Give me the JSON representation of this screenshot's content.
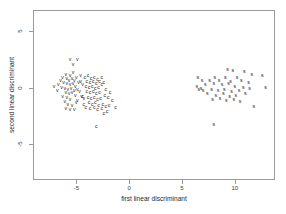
{
  "chart_data": {
    "type": "scatter",
    "title": "",
    "xlabel": "first linear discriminant",
    "ylabel": "second linear discriminant",
    "xlim": [
      -9.1,
      13.8
    ],
    "ylim": [
      -8.2,
      6.9
    ],
    "xticks": [
      -5,
      0,
      5,
      10
    ],
    "xticklabels": [
      "-5",
      "0",
      "5",
      "10"
    ],
    "yticks": [
      5,
      0,
      -5
    ],
    "yticklabels": [
      "5",
      "0",
      "-5"
    ],
    "grid": false,
    "legend": "none",
    "marker_style": "text-glyph",
    "series": [
      {
        "name": "v",
        "label": "v",
        "color": "#1a1a1a",
        "points": [
          [
            -5.6,
            2.5
          ],
          [
            -4.9,
            2.5
          ],
          [
            -5.3,
            2.0
          ],
          [
            -7.1,
            0.1
          ],
          [
            -6.3,
            0.9
          ],
          [
            -6.0,
            1.1
          ],
          [
            -5.6,
            1.0
          ],
          [
            -5.9,
            0.8
          ],
          [
            -5.7,
            0.6
          ],
          [
            -5.4,
            0.8
          ],
          [
            -5.2,
            0.6
          ],
          [
            -5.0,
            0.9
          ],
          [
            -6.2,
            0.4
          ],
          [
            -5.9,
            0.3
          ],
          [
            -5.6,
            0.2
          ],
          [
            -5.3,
            0.3
          ],
          [
            -5.1,
            0.1
          ],
          [
            -4.8,
            0.4
          ],
          [
            -6.4,
            0.0
          ],
          [
            -6.1,
            -0.1
          ],
          [
            -5.8,
            -0.2
          ],
          [
            -5.5,
            -0.1
          ],
          [
            -5.2,
            -0.3
          ],
          [
            -4.9,
            -0.2
          ],
          [
            -6.0,
            -0.5
          ],
          [
            -5.7,
            -0.6
          ],
          [
            -5.4,
            -0.5
          ],
          [
            -5.1,
            -0.7
          ],
          [
            -6.3,
            -0.8
          ],
          [
            -5.9,
            -0.9
          ],
          [
            -5.6,
            -1.1
          ],
          [
            -6.1,
            -1.3
          ],
          [
            -5.8,
            -1.5
          ],
          [
            -5.4,
            -1.6
          ],
          [
            -6.0,
            -1.9
          ],
          [
            -5.6,
            -2.0
          ],
          [
            -5.2,
            -2.0
          ],
          [
            -4.6,
            0.5
          ],
          [
            -4.4,
            0.2
          ],
          [
            -4.7,
            -0.4
          ],
          [
            -4.5,
            -0.8
          ],
          [
            -4.3,
            -1.0
          ],
          [
            -4.9,
            -1.2
          ],
          [
            -6.5,
            0.6
          ],
          [
            -6.7,
            0.2
          ],
          [
            -5.0,
            -1.4
          ],
          [
            -4.6,
            1.0
          ],
          [
            -6.8,
            -0.3
          ],
          [
            -5.3,
            1.3
          ]
        ]
      },
      {
        "name": "c",
        "label": "c",
        "color": "#1a1a1a",
        "points": [
          [
            -4.2,
            0.9
          ],
          [
            -3.9,
            1.0
          ],
          [
            -3.6,
            0.8
          ],
          [
            -3.3,
            0.9
          ],
          [
            -3.0,
            0.7
          ],
          [
            -4.0,
            0.5
          ],
          [
            -3.7,
            0.4
          ],
          [
            -3.4,
            0.5
          ],
          [
            -3.1,
            0.3
          ],
          [
            -2.8,
            0.5
          ],
          [
            -4.1,
            0.1
          ],
          [
            -3.8,
            0.0
          ],
          [
            -3.5,
            0.1
          ],
          [
            -3.2,
            -0.1
          ],
          [
            -2.9,
            0.0
          ],
          [
            -2.6,
            0.2
          ],
          [
            -4.0,
            -0.4
          ],
          [
            -3.7,
            -0.5
          ],
          [
            -3.4,
            -0.4
          ],
          [
            -3.1,
            -0.6
          ],
          [
            -2.8,
            -0.5
          ],
          [
            -3.9,
            -0.9
          ],
          [
            -3.6,
            -1.0
          ],
          [
            -3.3,
            -0.9
          ],
          [
            -3.0,
            -1.1
          ],
          [
            -2.7,
            -1.0
          ],
          [
            -2.3,
            -0.7
          ],
          [
            -2.0,
            -0.9
          ],
          [
            -1.6,
            -1.2
          ],
          [
            -3.8,
            -1.4
          ],
          [
            -3.5,
            -1.5
          ],
          [
            -3.2,
            -1.4
          ],
          [
            -2.9,
            -1.6
          ],
          [
            -2.5,
            -1.5
          ],
          [
            -2.2,
            -1.7
          ],
          [
            -1.9,
            -1.6
          ],
          [
            -4.1,
            -1.8
          ],
          [
            -3.7,
            -1.9
          ],
          [
            -3.3,
            -1.8
          ],
          [
            -3.0,
            -2.0
          ],
          [
            -2.6,
            -1.9
          ],
          [
            -1.3,
            -1.8
          ],
          [
            -2.1,
            -2.2
          ],
          [
            -2.4,
            -2.3
          ],
          [
            -3.1,
            -3.5
          ],
          [
            -4.4,
            -0.8
          ],
          [
            -4.3,
            -1.5
          ],
          [
            -2.6,
            0.9
          ],
          [
            -2.4,
            0.4
          ],
          [
            -2.2,
            -0.2
          ],
          [
            -1.8,
            -0.5
          ]
        ]
      },
      {
        "name": "s",
        "label": "s",
        "color": "#1a1a1a",
        "points": [
          [
            9.3,
            1.6
          ],
          [
            8.1,
            0.9
          ],
          [
            9.1,
            0.9
          ],
          [
            10.2,
            0.9
          ],
          [
            11.6,
            1.1
          ],
          [
            12.6,
            1.0
          ],
          [
            6.9,
            0.6
          ],
          [
            7.6,
            0.6
          ],
          [
            8.5,
            0.6
          ],
          [
            9.6,
            0.5
          ],
          [
            10.6,
            0.6
          ],
          [
            11.3,
            0.4
          ],
          [
            6.4,
            0.1
          ],
          [
            7.2,
            0.2
          ],
          [
            8.0,
            0.3
          ],
          [
            8.8,
            0.2
          ],
          [
            9.4,
            0.3
          ],
          [
            10.0,
            0.1
          ],
          [
            10.8,
            0.0
          ],
          [
            12.9,
            0.0
          ],
          [
            6.6,
            -0.2
          ],
          [
            7.0,
            -0.3
          ],
          [
            7.8,
            -0.2
          ],
          [
            8.4,
            -0.3
          ],
          [
            9.0,
            -0.2
          ],
          [
            9.7,
            -0.4
          ],
          [
            10.4,
            -0.3
          ],
          [
            6.8,
            -0.1
          ],
          [
            7.4,
            -0.6
          ],
          [
            8.2,
            -0.7
          ],
          [
            8.9,
            -0.6
          ],
          [
            9.5,
            -0.8
          ],
          [
            10.1,
            -0.7
          ],
          [
            11.0,
            -0.6
          ],
          [
            7.9,
            -1.1
          ],
          [
            8.6,
            -1.0
          ],
          [
            9.2,
            -1.2
          ],
          [
            9.9,
            -1.1
          ],
          [
            10.5,
            -1.3
          ],
          [
            11.8,
            -1.7
          ],
          [
            8.0,
            -3.3
          ],
          [
            9.8,
            1.5
          ],
          [
            10.9,
            1.4
          ],
          [
            6.5,
            0.9
          ],
          [
            11.4,
            -0.1
          ]
        ]
      }
    ]
  }
}
